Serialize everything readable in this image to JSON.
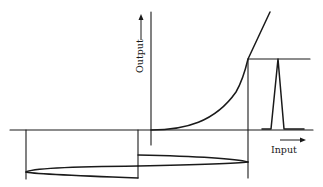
{
  "diagram": {
    "type": "transfer-characteristic",
    "axes": {
      "x_label": "Input",
      "y_label": "Output"
    },
    "colors": {
      "line": "#1a1a1a",
      "background": "#ffffff"
    },
    "elements": [
      {
        "name": "output-axis",
        "description": "vertical axis with upward arrow labeled Output"
      },
      {
        "name": "input-axis",
        "description": "horizontal axis with rightward arrow labeled Input"
      },
      {
        "name": "transfer-curve",
        "description": "exponential-like curve starting at origin, becoming linear"
      },
      {
        "name": "output-pulse",
        "description": "narrow triangular output pulse on the right, peak projected from curve"
      },
      {
        "name": "input-waveform",
        "description": "input signal drawn below the axis, projected to the curve"
      }
    ]
  }
}
